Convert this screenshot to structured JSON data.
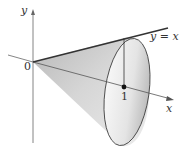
{
  "diagram": {
    "type": "solid-of-revolution",
    "labels": {
      "y_axis": "y",
      "x_axis": "x",
      "origin": "0",
      "line": "y = x",
      "point": "1"
    },
    "colors": {
      "axis": "#555555",
      "line": "#333333",
      "cone_shade_dark": "#9a9a9a",
      "cone_shade_light": "#f2f2f2",
      "point": "#111111"
    }
  }
}
